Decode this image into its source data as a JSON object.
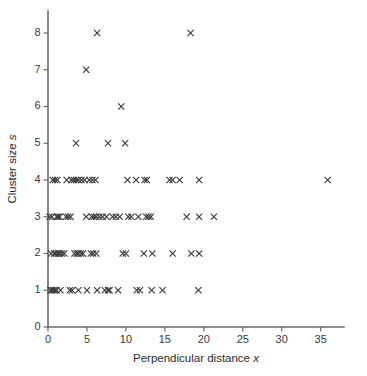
{
  "chart_data": {
    "type": "scatter",
    "title": "",
    "xlabel": "Perpendicular distance x",
    "xlabel_plain": "Perpendicular distance",
    "xlabel_italic_symbol": "x",
    "ylabel": "Cluster size s",
    "ylabel_plain": "Cluster size",
    "ylabel_italic_symbol": "s",
    "xlim": [
      0,
      38
    ],
    "ylim": [
      0,
      8.6
    ],
    "xticks": [
      0,
      5,
      10,
      15,
      20,
      25,
      30,
      35
    ],
    "xticklabels": [
      "0",
      "5",
      "10",
      "15",
      "20",
      "25",
      "30",
      "35"
    ],
    "yticks": [
      0,
      1,
      2,
      3,
      4,
      5,
      6,
      7,
      8
    ],
    "yticklabels": [
      "0",
      "1",
      "2",
      "3",
      "4",
      "5",
      "6",
      "7",
      "8"
    ],
    "grid": false,
    "legend": null,
    "marker": "x",
    "marker_color": "#3a3a3a",
    "marker_size": 5,
    "axis_color": "#6a6a6a",
    "background_color": "#ffffff",
    "series": [
      {
        "name": "Cluster observations",
        "points": [
          [
            0.3,
            1
          ],
          [
            0.5,
            1
          ],
          [
            0.7,
            1
          ],
          [
            0.9,
            1
          ],
          [
            1.1,
            1
          ],
          [
            1.6,
            1
          ],
          [
            2.8,
            1
          ],
          [
            3.1,
            1
          ],
          [
            3.9,
            1
          ],
          [
            5.0,
            1
          ],
          [
            6.3,
            1
          ],
          [
            7.3,
            1
          ],
          [
            7.7,
            1
          ],
          [
            7.9,
            1
          ],
          [
            9.0,
            1
          ],
          [
            11.4,
            1
          ],
          [
            11.8,
            1
          ],
          [
            13.3,
            1
          ],
          [
            14.7,
            1
          ],
          [
            19.3,
            1
          ],
          [
            0.4,
            2
          ],
          [
            0.8,
            2
          ],
          [
            1.0,
            2
          ],
          [
            1.3,
            2
          ],
          [
            1.5,
            2
          ],
          [
            1.8,
            2
          ],
          [
            2.1,
            2
          ],
          [
            3.4,
            2
          ],
          [
            3.7,
            2
          ],
          [
            3.9,
            2
          ],
          [
            4.2,
            2
          ],
          [
            4.5,
            2
          ],
          [
            5.5,
            2
          ],
          [
            5.8,
            2
          ],
          [
            6.2,
            2
          ],
          [
            9.6,
            2
          ],
          [
            10.0,
            2
          ],
          [
            12.3,
            2
          ],
          [
            13.4,
            2
          ],
          [
            16.0,
            2
          ],
          [
            18.4,
            2
          ],
          [
            19.4,
            2
          ],
          [
            0.2,
            3
          ],
          [
            0.5,
            3
          ],
          [
            1.1,
            3
          ],
          [
            1.3,
            3
          ],
          [
            1.5,
            3
          ],
          [
            2.3,
            3
          ],
          [
            2.6,
            3
          ],
          [
            2.9,
            3
          ],
          [
            4.9,
            3
          ],
          [
            5.6,
            3
          ],
          [
            5.9,
            3
          ],
          [
            6.2,
            3
          ],
          [
            6.6,
            3
          ],
          [
            7.0,
            3
          ],
          [
            7.5,
            3
          ],
          [
            8.3,
            3
          ],
          [
            8.7,
            3
          ],
          [
            9.2,
            3
          ],
          [
            10.3,
            3
          ],
          [
            10.7,
            3
          ],
          [
            11.6,
            3
          ],
          [
            12.6,
            3
          ],
          [
            12.9,
            3
          ],
          [
            13.2,
            3
          ],
          [
            17.8,
            3
          ],
          [
            19.4,
            3
          ],
          [
            21.3,
            3
          ],
          [
            0.6,
            4
          ],
          [
            0.9,
            4
          ],
          [
            1.2,
            4
          ],
          [
            2.4,
            4
          ],
          [
            3.0,
            4
          ],
          [
            3.3,
            4
          ],
          [
            3.6,
            4
          ],
          [
            3.9,
            4
          ],
          [
            4.3,
            4
          ],
          [
            4.7,
            4
          ],
          [
            5.3,
            4
          ],
          [
            5.7,
            4
          ],
          [
            6.1,
            4
          ],
          [
            10.2,
            4
          ],
          [
            11.3,
            4
          ],
          [
            12.4,
            4
          ],
          [
            12.7,
            4
          ],
          [
            15.6,
            4
          ],
          [
            16.0,
            4
          ],
          [
            16.9,
            4
          ],
          [
            19.4,
            4
          ],
          [
            35.9,
            4
          ],
          [
            3.6,
            5
          ],
          [
            7.7,
            5
          ],
          [
            9.9,
            5
          ],
          [
            9.4,
            6
          ],
          [
            4.9,
            7
          ],
          [
            6.3,
            8
          ],
          [
            18.3,
            8
          ]
        ]
      }
    ],
    "point_count": 103
  },
  "figure": {
    "width": 367,
    "height": 376
  }
}
